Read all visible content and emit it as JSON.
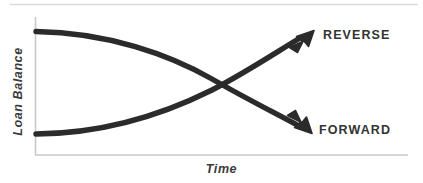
{
  "figure": {
    "width": 423,
    "height": 183,
    "background_color": "#ffffff",
    "top_rule_color": "#dcdcdc",
    "axis_color": "#c9c9c9",
    "curve_color": "#2b2b2b",
    "label_color": "#333333",
    "axis_label_color": "#3a3a3a"
  },
  "axes": {
    "y_title": "Loan Balance",
    "x_title": "Time",
    "y_axis_x": 35,
    "y_axis_top": 17,
    "y_axis_bottom": 155,
    "x_axis_y": 155,
    "x_axis_left": 35,
    "x_axis_right": 408
  },
  "labels": {
    "reverse": "REVERSE",
    "forward": "FORWARD"
  },
  "chart_data": {
    "type": "line",
    "title": "",
    "xlabel": "Time",
    "ylabel": "Loan Balance",
    "grid": false,
    "legend_position": "inline-right",
    "axis_ticks": {
      "x": [],
      "y": []
    },
    "xlim": [
      0,
      1
    ],
    "ylim": [
      0,
      1
    ],
    "crossing_point": {
      "x": 0.53,
      "y": 0.52
    },
    "series": [
      {
        "name": "REVERSE",
        "description": "Loan balance starts high and declines, then rises sharply upward to an arrowhead",
        "arrow_end": true,
        "x": [
          0.0,
          0.12,
          0.25,
          0.38,
          0.5,
          0.62,
          0.75,
          0.88,
          1.0
        ],
        "y": [
          0.9,
          0.88,
          0.82,
          0.72,
          0.58,
          0.44,
          0.31,
          0.2,
          0.12
        ]
      },
      {
        "name": "FORWARD",
        "description": "Loan balance starts low and rises, then falls to an arrowhead",
        "arrow_end": true,
        "x": [
          0.0,
          0.12,
          0.25,
          0.38,
          0.5,
          0.62,
          0.75,
          0.88,
          1.0
        ],
        "y": [
          0.16,
          0.18,
          0.24,
          0.34,
          0.46,
          0.6,
          0.72,
          0.82,
          0.9
        ]
      }
    ]
  }
}
